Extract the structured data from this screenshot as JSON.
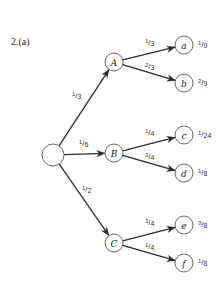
{
  "title": "2.(a)",
  "diagram": {
    "type": "probability-tree",
    "root": {
      "x": 53,
      "y": 155,
      "r": 11
    },
    "first_level": [
      {
        "id": "A",
        "label": "A",
        "x": 114,
        "y": 62,
        "prob_num": "1",
        "prob_den": "3",
        "label_x": 72,
        "label_y": 98
      },
      {
        "id": "B",
        "label": "B",
        "x": 114,
        "y": 153,
        "prob_num": "1",
        "prob_den": "6",
        "label_x": 79,
        "label_y": 146
      },
      {
        "id": "C",
        "label": "C",
        "x": 114,
        "y": 243,
        "prob_num": "1",
        "prob_den": "2",
        "label_x": 82,
        "label_y": 192
      }
    ],
    "leaves": [
      {
        "id": "a",
        "label": "a",
        "parent": "A",
        "x": 184,
        "y": 45,
        "branch_num": "1",
        "branch_den": "3",
        "bx": 145,
        "by": 45,
        "joint_num": "1",
        "joint_den": "9"
      },
      {
        "id": "b",
        "label": "b",
        "parent": "A",
        "x": 184,
        "y": 83,
        "branch_num": "2",
        "branch_den": "3",
        "bx": 145,
        "by": 69,
        "joint_num": "2",
        "joint_den": "9"
      },
      {
        "id": "c",
        "label": "c",
        "parent": "B",
        "x": 184,
        "y": 135,
        "branch_num": "1",
        "branch_den": "4",
        "bx": 145,
        "by": 135,
        "joint_num": "1",
        "joint_den": "24"
      },
      {
        "id": "d",
        "label": "d",
        "parent": "B",
        "x": 184,
        "y": 173,
        "branch_num": "3",
        "branch_den": "4",
        "bx": 145,
        "by": 159,
        "joint_num": "1",
        "joint_den": "8"
      },
      {
        "id": "e",
        "label": "e",
        "parent": "C",
        "x": 184,
        "y": 225,
        "branch_num": "3",
        "branch_den": "4",
        "bx": 145,
        "by": 225,
        "joint_num": "3",
        "joint_den": "8"
      },
      {
        "id": "f",
        "label": "f",
        "parent": "C",
        "x": 184,
        "y": 263,
        "branch_num": "1",
        "branch_den": "4",
        "bx": 145,
        "by": 249,
        "joint_num": "1",
        "joint_den": "8"
      }
    ]
  }
}
